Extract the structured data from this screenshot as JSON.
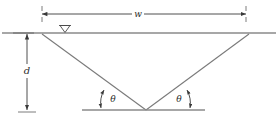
{
  "figure": {
    "type": "engineering-diagram",
    "background_color": "#ffffff",
    "line_color": "#7a7a7a",
    "dimension_color": "#3a3a3a",
    "label_color": "#2b2b2b"
  },
  "labels": {
    "width": "w",
    "depth": "d",
    "angle_left": "θ",
    "angle_right": "θ"
  },
  "elements": {
    "ground_line": "ground-surface-line",
    "base_line": "base-reference-line",
    "left_slope": "left-trench-slope",
    "right_slope": "right-trench-slope",
    "water_table": "▽",
    "width_dimension": "width-dimension-line",
    "depth_dimension": "depth-dimension-line",
    "angle_arc_left": "left-angle-arc",
    "angle_arc_right": "right-angle-arc"
  },
  "geometry": {
    "ground_y": 33,
    "base_y": 110,
    "apex_x": 146,
    "apex_y": 110,
    "left_top_x": 42,
    "right_top_x": 249,
    "width_dim_y": 14,
    "depth_dim_x": 27
  }
}
